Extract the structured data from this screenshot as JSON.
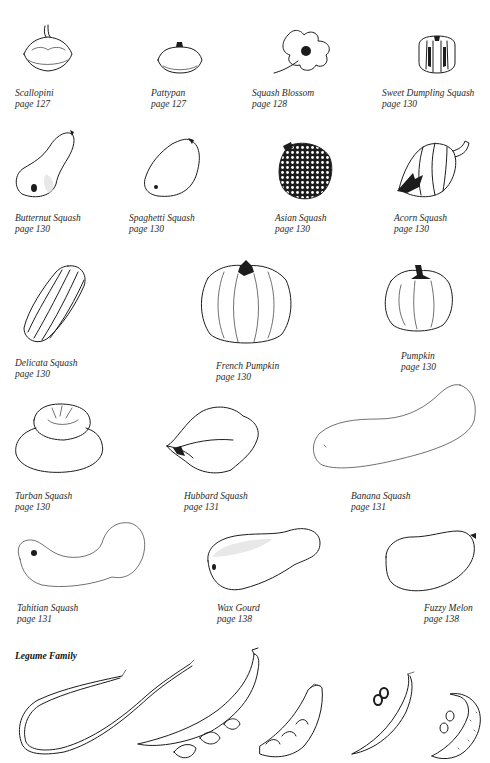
{
  "page": {
    "sections": [
      {
        "title": "",
        "items": [
          {
            "name": "Scallopini",
            "page": "page 127"
          },
          {
            "name": "Pattypan",
            "page": "page 127"
          },
          {
            "name": "Squash Blossom",
            "page": "page 128"
          },
          {
            "name": "Sweet Dumpling Squash",
            "page": "page 130"
          },
          {
            "name": "Butternut Squash",
            "page": "page 130"
          },
          {
            "name": "Spaghetti Squash",
            "page": "page 130"
          },
          {
            "name": "Asian Squash",
            "page": "page 130"
          },
          {
            "name": "Acorn Squash",
            "page": "page 130"
          },
          {
            "name": "Delicata Squash",
            "page": "page 130"
          },
          {
            "name": "French Pumpkin",
            "page": "page 130"
          },
          {
            "name": "Pumpkin",
            "page": "page 130"
          },
          {
            "name": "Turban Squash",
            "page": "page 130"
          },
          {
            "name": "Hubbard Squash",
            "page": "page 131"
          },
          {
            "name": "Banana Squash",
            "page": "page 131"
          },
          {
            "name": "Tahitian Squash",
            "page": "page 131"
          },
          {
            "name": "Wax Gourd",
            "page": "page 138"
          },
          {
            "name": "Fuzzy Melon",
            "page": "page 138"
          }
        ]
      },
      {
        "title": "Legume Family",
        "items": []
      }
    ]
  }
}
